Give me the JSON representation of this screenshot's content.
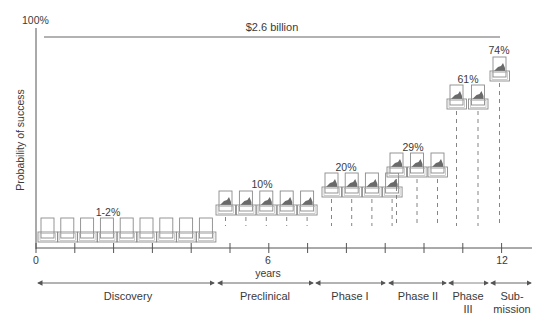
{
  "y_axis": {
    "label": "Probability of success",
    "top_label": "100%"
  },
  "x_axis": {
    "label": "years",
    "ticks": [
      "0",
      "6",
      "12"
    ],
    "tick_count": 13
  },
  "cost_label": "$2.6 billion",
  "stages": [
    {
      "name": "Discovery",
      "probability": "1-2%",
      "compounds": 9
    },
    {
      "name": "Preclinical",
      "probability": "10%",
      "compounds": 5
    },
    {
      "name": "Phase I",
      "probability": "20%",
      "compounds": 4
    },
    {
      "name": "Phase II",
      "probability": "29%",
      "compounds": 3
    },
    {
      "name": "Phase III",
      "name_line1": "Phase",
      "name_line2": "III",
      "probability": "61%",
      "compounds": 2
    },
    {
      "name": "Submission",
      "name_line1": "Sub-",
      "name_line2": "mission",
      "probability": "74%",
      "compounds": 1
    }
  ],
  "colors": {
    "axis": "#555555",
    "box_stroke": "#8a8a8a",
    "fill": "#6a6a6a",
    "text": "#3a3a3a"
  },
  "chart_data": {
    "type": "table",
    "xlabel": "years",
    "ylabel": "Probability of success",
    "xlim": [
      0,
      12.8
    ],
    "ylim": [
      0,
      100
    ],
    "categories": [
      "Discovery",
      "Preclinical",
      "Phase I",
      "Phase II",
      "Phase III",
      "Submission"
    ],
    "series": [
      {
        "name": "Probability of success (%)",
        "values": [
          "1-2",
          10,
          20,
          29,
          61,
          74
        ]
      },
      {
        "name": "Number of compounds (icons)",
        "values": [
          9,
          5,
          4,
          3,
          2,
          1
        ]
      }
    ],
    "annotations": [
      "$2.6 billion",
      "100%"
    ],
    "x_tick_labels": [
      "0",
      "6",
      "12"
    ],
    "grid": false
  }
}
